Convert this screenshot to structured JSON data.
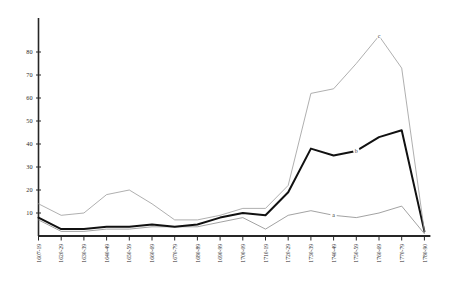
{
  "chart_data": {
    "type": "line",
    "title": "",
    "subtitle": "",
    "xlabel": "",
    "ylabel": "",
    "ylim": [
      0,
      85
    ],
    "yticks": [
      0,
      10,
      20,
      30,
      40,
      50,
      60,
      70,
      80
    ],
    "grid": false,
    "legend_position": "inline-labels",
    "categories": [
      "1607-19",
      "1620-29",
      "1630-39",
      "1640-49",
      "1650-59",
      "1660-69",
      "1670-79",
      "1680-89",
      "1690-99",
      "1700-09",
      "1710-19",
      "1720-29",
      "1730-39",
      "1740-49",
      "1750-59",
      "1760-69",
      "1770-79",
      "1780-90"
    ],
    "series": [
      {
        "name": "a",
        "label": "a",
        "color": "#8a8a8a",
        "width": 0.8,
        "label_index": 13,
        "values": [
          7,
          2,
          2,
          3,
          3,
          4,
          4,
          4,
          6,
          8,
          3,
          9,
          11,
          9,
          8,
          10,
          13,
          1
        ]
      },
      {
        "name": "b",
        "label": "b",
        "color": "#111111",
        "width": 2.0,
        "label_index": 14,
        "values": [
          8,
          3,
          3,
          4,
          4,
          5,
          4,
          5,
          8,
          10,
          9,
          19,
          38,
          35,
          37,
          43,
          46,
          2
        ]
      },
      {
        "name": "c",
        "label": "c",
        "color": "#9a9a9a",
        "width": 0.8,
        "label_index": 15,
        "values": [
          14,
          9,
          10,
          18,
          20,
          14,
          7,
          7,
          9,
          12,
          12,
          22,
          62,
          64,
          75,
          87,
          73,
          2
        ]
      }
    ]
  },
  "axis": {
    "y_tick_labels": [
      "80",
      "70",
      "60",
      "50",
      "40",
      "30",
      "20",
      "10"
    ],
    "x_tick_labels": [
      "1607-19",
      "1620-29",
      "1630-39",
      "1640-49",
      "1650-59",
      "1660-69",
      "1670-79",
      "1680-89",
      "1690-99",
      "1700-09",
      "1710-19",
      "1720-29",
      "1730-39",
      "1740-49",
      "1750-59",
      "1760-69",
      "1770-79",
      "1780-90"
    ]
  }
}
